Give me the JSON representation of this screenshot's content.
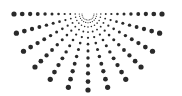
{
  "graphic": {
    "name": "half-sunburst-dot-pattern",
    "background": "#ffffff",
    "dot_color": "#2a2a2a",
    "center": {
      "x": 88,
      "y": 14
    },
    "ray_count": 13,
    "start_angle_deg": 0,
    "end_angle_deg": 180,
    "dots_per_ray": 12,
    "inner_radius": 6,
    "outer_radius_horizontal": 74,
    "outer_radius_vertical": 76,
    "min_dot_radius": 0.5,
    "max_dot_radius": 2.6
  }
}
